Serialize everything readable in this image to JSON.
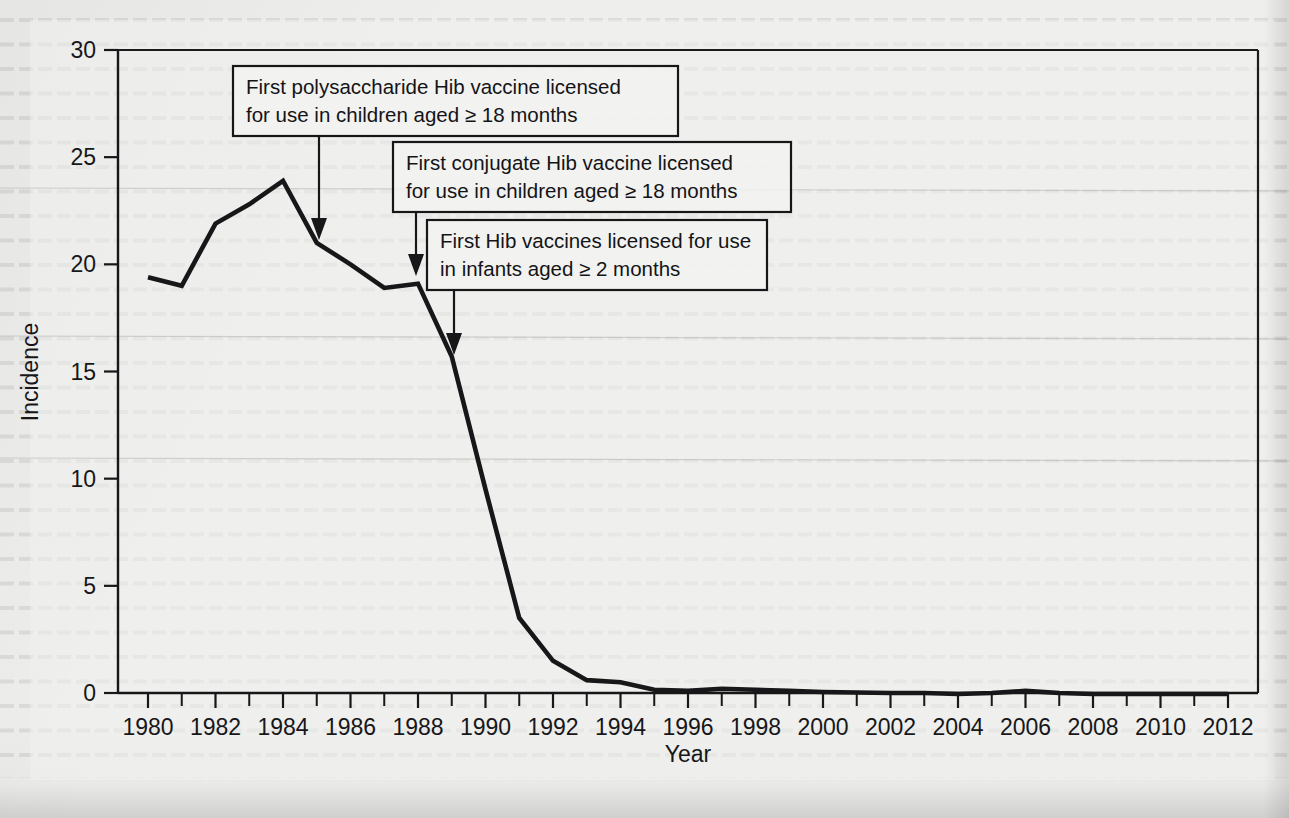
{
  "figure": {
    "type": "line-chart",
    "background_color": "#eeeeec",
    "ink_color": "#17171a"
  },
  "axes": {
    "x_title": "Year",
    "y_title": "Incidence",
    "x_tick_labels": [
      "1980",
      "1982",
      "1984",
      "1986",
      "1988",
      "1990",
      "1992",
      "1994",
      "1996",
      "1998",
      "2000",
      "2002",
      "2004",
      "2006",
      "2008",
      "2010",
      "2012"
    ],
    "y_tick_labels": [
      "0",
      "5",
      "10",
      "15",
      "20",
      "25",
      "30"
    ]
  },
  "annotations": [
    {
      "id": "polysaccharide",
      "line1": "First polysaccharide Hib vaccine licensed",
      "line2": "for use in children aged ≥ 18 months",
      "points_to_year": 1985
    },
    {
      "id": "conjugate",
      "line1": "First conjugate Hib vaccine licensed",
      "line2": "for use in children aged ≥ 18 months",
      "points_to_year": 1987
    },
    {
      "id": "infants",
      "line1": "First Hib vaccines licensed for use",
      "line2": "in infants aged ≥ 2 months",
      "points_to_year": 1989
    }
  ],
  "chart_data": {
    "type": "line",
    "title": "",
    "xlabel": "Year",
    "ylabel": "Incidence",
    "xlim": [
      1980,
      2012
    ],
    "ylim": [
      0,
      30
    ],
    "grid": false,
    "legend": "none",
    "x": [
      1980,
      1981,
      1982,
      1983,
      1984,
      1985,
      1986,
      1987,
      1988,
      1989,
      1990,
      1991,
      1992,
      1993,
      1994,
      1995,
      1996,
      1997,
      1998,
      1999,
      2000,
      2001,
      2002,
      2003,
      2004,
      2005,
      2006,
      2007,
      2008,
      2009,
      2010,
      2011,
      2012
    ],
    "series": [
      {
        "name": "Haemophilus influenzae type b incidence",
        "values": [
          19.4,
          19.0,
          21.9,
          22.8,
          23.9,
          21.0,
          20.0,
          18.9,
          19.1,
          15.7,
          9.5,
          3.5,
          1.5,
          0.6,
          0.5,
          0.15,
          0.1,
          0.2,
          0.15,
          0.1,
          0.05,
          0.02,
          0.0,
          0.0,
          -0.05,
          0.0,
          0.1,
          0.0,
          -0.05,
          -0.05,
          -0.05,
          -0.05,
          -0.05
        ]
      }
    ]
  }
}
